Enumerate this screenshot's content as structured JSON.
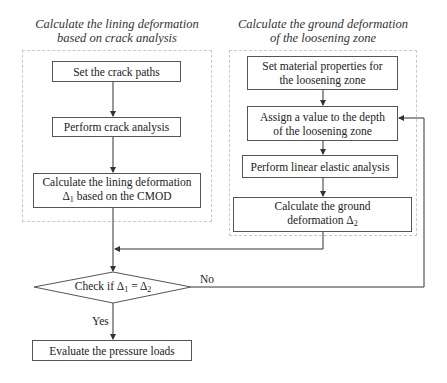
{
  "left_group": {
    "title_line1": "Calculate the lining deformation",
    "title_line2": "based on crack analysis",
    "steps": [
      {
        "line1": "Set the crack paths"
      },
      {
        "line1": "Perform crack analysis"
      },
      {
        "line1": "Calculate the lining deformation",
        "line2_prefix": "Δ",
        "line2_sub": "1",
        "line2_suffix": " based on the CMOD"
      }
    ]
  },
  "right_group": {
    "title_line1": "Calculate the ground deformation",
    "title_line2": "of the loosening zone",
    "steps": [
      {
        "line1": "Set material properties for",
        "line2": "the loosening zone"
      },
      {
        "line1": "Assign a value to the depth",
        "line2": "of the loosening zone"
      },
      {
        "line1": "Perform linear elastic analysis"
      },
      {
        "line1": "Calculate the ground",
        "line2_prefix": "deformation Δ",
        "line2_sub": "2"
      }
    ]
  },
  "decision": {
    "prefix": "Check if Δ",
    "sub1": "1",
    "middle": " = Δ",
    "sub2": "2",
    "yes_label": "Yes",
    "no_label": "No"
  },
  "final_step": {
    "label": "Evaluate the pressure loads"
  },
  "colors": {
    "line": "#333333",
    "box_border": "#555555",
    "group_border": "#c8c8c8"
  }
}
